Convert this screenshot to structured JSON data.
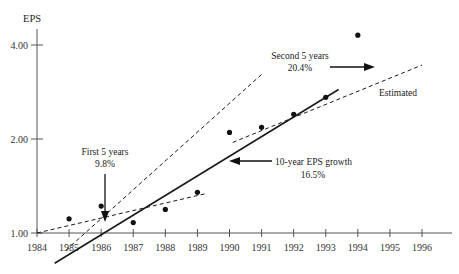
{
  "chart_data": {
    "type": "scatter",
    "title": "",
    "ylabel": "EPS",
    "xlabel": "",
    "scale": "log",
    "grid": false,
    "legend_position": "none",
    "xlim": [
      1984,
      1996
    ],
    "ylim": [
      1.0,
      4.6
    ],
    "x_tick_labels": [
      "1984",
      "1985",
      "1986",
      "1987",
      "1988",
      "1989",
      "1990",
      "1991",
      "1992",
      "1993",
      "1994",
      "1995",
      "1996"
    ],
    "y_tick_labels": [
      "1.00",
      "2.00",
      "4.00"
    ],
    "y_tick_values": [
      1.0,
      2.0,
      4.0
    ],
    "points": [
      {
        "x": 1985,
        "y": 1.11
      },
      {
        "x": 1986,
        "y": 1.22
      },
      {
        "x": 1987,
        "y": 1.08
      },
      {
        "x": 1988,
        "y": 1.19
      },
      {
        "x": 1989,
        "y": 1.35
      },
      {
        "x": 1990,
        "y": 2.1
      },
      {
        "x": 1991,
        "y": 2.18
      },
      {
        "x": 1992,
        "y": 2.4
      },
      {
        "x": 1993,
        "y": 2.72
      },
      {
        "x": 1994,
        "y": 4.3
      }
    ],
    "series": [
      {
        "name": "10-year EPS growth",
        "style": "solid",
        "growth_rate": "16.5%",
        "x_start": 1984.55,
        "x_end": 1993.4,
        "y_start": 0.8,
        "y_end": 2.88
      },
      {
        "name": "First 5 years",
        "style": "dashed",
        "growth_rate": "9.8%",
        "x_start": 1984.0,
        "x_end": 1989.3,
        "y_start": 1.0,
        "y_end": 1.34
      },
      {
        "name": "Second 5 years",
        "style": "dashed",
        "growth_rate": "20.4%",
        "x_start": 1984.9,
        "x_end": 1991.0,
        "y_start": 0.88,
        "y_end": 3.22
      },
      {
        "name": "Estimated",
        "style": "dashed",
        "x_start": 1990.1,
        "x_end": 1996.0,
        "y_start": 1.95,
        "y_end": 3.45
      }
    ],
    "annotations": [
      {
        "id": "first-five-years",
        "line1": "First 5 years",
        "line2": "9.8%",
        "arrow": "down"
      },
      {
        "id": "second-five-years",
        "line1": "Second 5 years",
        "line2": "20.4%",
        "arrow": "right"
      },
      {
        "id": "ten-year-growth",
        "line1": "10-year EPS growth",
        "line2": "16.5%",
        "arrow": "left"
      },
      {
        "id": "estimated",
        "line1": "Estimated",
        "line2": "",
        "arrow": "none"
      }
    ],
    "colors": {
      "line": "#1a1a1a",
      "point": "#111111",
      "axis": "#555555",
      "text": "#222222",
      "background": "#ffffff"
    }
  }
}
